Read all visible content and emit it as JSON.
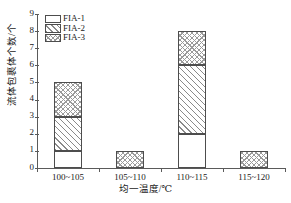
{
  "chart_data": {
    "type": "bar",
    "stacked": true,
    "title": "",
    "subtitle": "",
    "xlabel": "均一温度/℃",
    "ylabel": "流体包裹体个数/个",
    "categories": [
      "100~105",
      "105~110",
      "110~115",
      "115~120"
    ],
    "series": [
      {
        "name": "FIA-1",
        "values": [
          1,
          0,
          2,
          0
        ],
        "pattern": "solid-white"
      },
      {
        "name": "FIA-2",
        "values": [
          2,
          0,
          4,
          0
        ],
        "pattern": "diagonal-hatch"
      },
      {
        "name": "FIA-3",
        "values": [
          2,
          1,
          2,
          1
        ],
        "pattern": "cross-hatch"
      }
    ],
    "totals": [
      5,
      1,
      8,
      1
    ],
    "ylim": [
      0,
      9
    ],
    "ytick_labels": [
      "0",
      "1",
      "2",
      "3",
      "4",
      "5",
      "6",
      "7",
      "8",
      "9"
    ],
    "ytick_values": [
      0,
      1,
      2,
      3,
      4,
      5,
      6,
      7,
      8,
      9
    ],
    "grid": false,
    "legend_position": "top-left",
    "frame": "open-left-bottom",
    "colors": {
      "axis": "#5a5a5a",
      "bar_outline": "#4d4d4d",
      "hatch": "#8a8a8a",
      "background": "#ffffff"
    }
  },
  "legend": {
    "entries": [
      {
        "label": "FIA-1"
      },
      {
        "label": "FIA-2"
      },
      {
        "label": "FIA-3"
      }
    ]
  }
}
